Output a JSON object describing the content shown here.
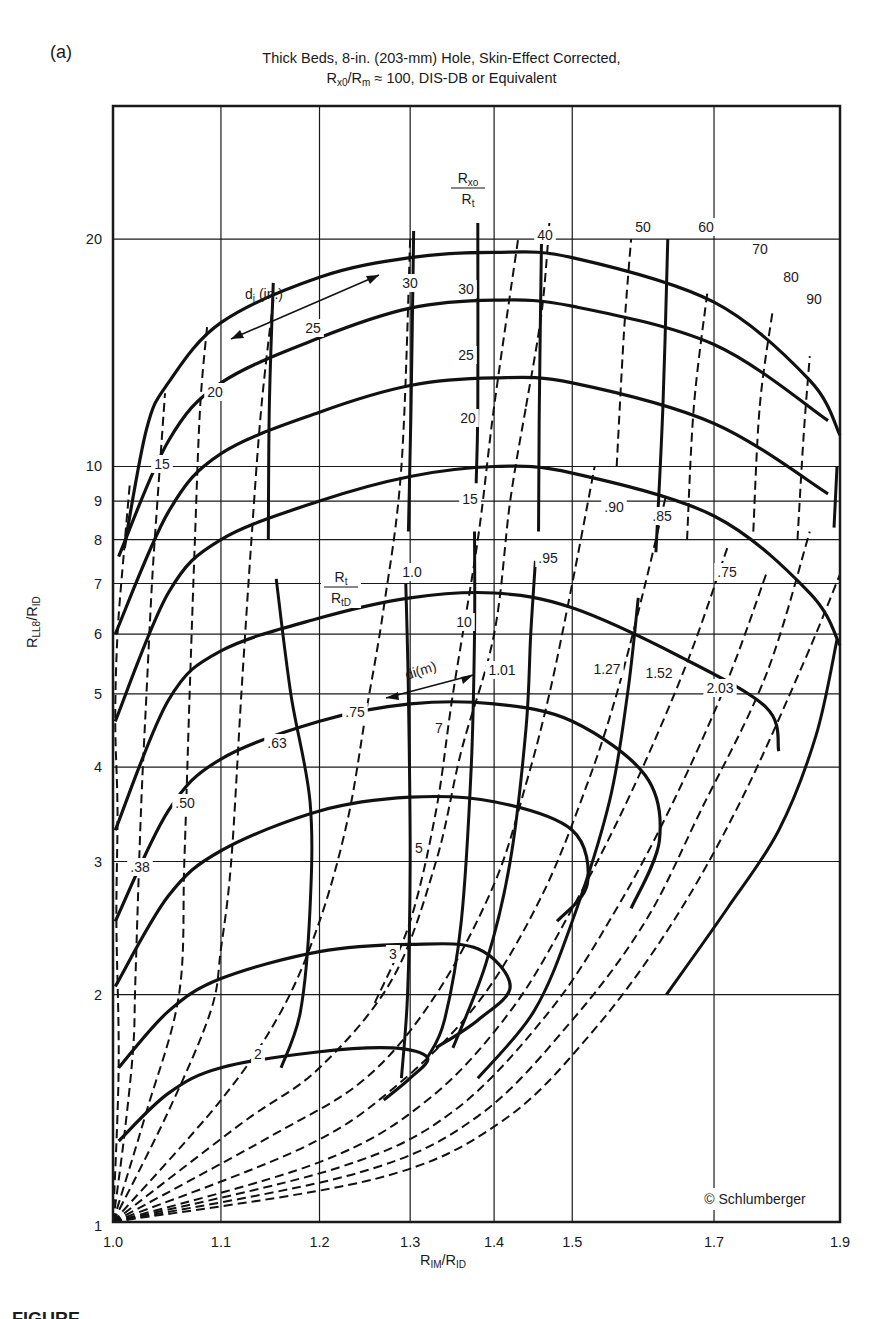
{
  "panel_label": "(a)",
  "title": {
    "line1": "Thick Beds, 8-in. (203-mm) Hole, Skin-Effect Corrected,",
    "line2_prefix": "R",
    "line2_sub1": "x0",
    "line2_mid": "/R",
    "line2_sub2": "m",
    "line2_suffix": " ≈ 100, DIS-DB or Equivalent"
  },
  "axes": {
    "x_title_main": "R",
    "x_title_sub1": "IM",
    "x_title_mid": "/R",
    "x_title_sub2": "ID",
    "y_title_main": "R",
    "y_title_sub1": "LL8",
    "y_title_mid": "/R",
    "y_title_sub2": "ID",
    "x_ticks": [
      "1.0",
      "1.1",
      "1.2",
      "1.3",
      "1.4",
      "1.5",
      "1.7",
      "1.9"
    ],
    "y_ticks": [
      "1",
      "2",
      "3",
      "4",
      "5",
      "6",
      "7",
      "8",
      "9",
      "10",
      "20"
    ]
  },
  "annotations": {
    "rxo_rt_num": "R",
    "rxo_rt_num_sub": "xo",
    "rxo_rt_den": "R",
    "rxo_rt_den_sub": "t",
    "rt_rtd_num": "R",
    "rt_rtd_num_sub": "t",
    "rt_rtd_den": "R",
    "rt_rtd_den_sub": "tD",
    "di_in": "d",
    "di_in_sub": "i",
    "di_in_unit": " (in.)",
    "di_m": "di(m)",
    "copyright": "© Schlumberger"
  },
  "caption_visible": "FIGURE",
  "chart_data": {
    "type": "line",
    "xlabel": "RIM/RID",
    "ylabel": "RLL8/RID",
    "xscale": "log",
    "yscale": "log",
    "xlim": [
      1.0,
      1.9
    ],
    "ylim": [
      1,
      30
    ],
    "grid": true,
    "x_ticks": [
      1.0,
      1.1,
      1.2,
      1.3,
      1.4,
      1.5,
      1.7,
      1.9
    ],
    "y_ticks": [
      1,
      2,
      3,
      4,
      5,
      6,
      7,
      8,
      9,
      10,
      20
    ],
    "rxo_rt_curves": {
      "style": "solid",
      "labels": [
        "2",
        "3",
        "5",
        "7",
        "10",
        "15",
        "20",
        "25",
        "30"
      ]
    },
    "rxo_rt_top_labels": [
      "40",
      "50",
      "60",
      "70",
      "80",
      "90"
    ],
    "di_in_curves": {
      "style": "dashed",
      "labels": [
        "15",
        "20",
        "25",
        "30"
      ]
    },
    "di_m_labels": [
      ".38",
      ".50",
      ".63",
      ".75",
      "1.01",
      "1.27",
      "1.52",
      "2.03"
    ],
    "rt_rtd_curves": {
      "style": "solid",
      "labels": [
        "1.0",
        ".95",
        ".90",
        ".85",
        ".75"
      ]
    },
    "series": [
      {
        "name": "Rxo/Rt=2",
        "points": [
          [
            1.005,
            1.28
          ],
          [
            1.05,
            1.48
          ],
          [
            1.1,
            1.6
          ],
          [
            1.2,
            1.68
          ],
          [
            1.28,
            1.7
          ],
          [
            1.32,
            1.65
          ],
          [
            1.3,
            1.55
          ],
          [
            1.27,
            1.45
          ]
        ]
      },
      {
        "name": "Rxo/Rt=3",
        "points": [
          [
            1.005,
            1.6
          ],
          [
            1.05,
            1.9
          ],
          [
            1.1,
            2.1
          ],
          [
            1.2,
            2.28
          ],
          [
            1.3,
            2.33
          ],
          [
            1.38,
            2.3
          ],
          [
            1.42,
            2.05
          ],
          [
            1.38,
            1.85
          ],
          [
            1.33,
            1.7
          ]
        ]
      },
      {
        "name": "Rxo/Rt=5",
        "points": [
          [
            1.002,
            2.05
          ],
          [
            1.05,
            2.7
          ],
          [
            1.1,
            3.1
          ],
          [
            1.2,
            3.5
          ],
          [
            1.3,
            3.65
          ],
          [
            1.4,
            3.6
          ],
          [
            1.5,
            3.3
          ],
          [
            1.52,
            2.8
          ],
          [
            1.48,
            2.5
          ]
        ]
      },
      {
        "name": "Rxo/Rt=7",
        "points": [
          [
            1.002,
            2.5
          ],
          [
            1.05,
            3.5
          ],
          [
            1.1,
            4.1
          ],
          [
            1.2,
            4.6
          ],
          [
            1.3,
            4.85
          ],
          [
            1.4,
            4.85
          ],
          [
            1.5,
            4.6
          ],
          [
            1.6,
            3.9
          ],
          [
            1.62,
            3.2
          ],
          [
            1.58,
            2.6
          ]
        ]
      },
      {
        "name": "Rxo/Rt=10",
        "points": [
          [
            1.002,
            3.3
          ],
          [
            1.05,
            4.9
          ],
          [
            1.1,
            5.7
          ],
          [
            1.2,
            6.3
          ],
          [
            1.3,
            6.7
          ],
          [
            1.4,
            6.8
          ],
          [
            1.5,
            6.5
          ],
          [
            1.65,
            5.6
          ],
          [
            1.78,
            4.8
          ],
          [
            1.8,
            4.2
          ]
        ]
      },
      {
        "name": "Rxo/Rt=15",
        "points": [
          [
            1.002,
            4.6
          ],
          [
            1.05,
            6.8
          ],
          [
            1.1,
            8.0
          ],
          [
            1.2,
            9.0
          ],
          [
            1.3,
            9.7
          ],
          [
            1.4,
            10.0
          ],
          [
            1.5,
            9.8
          ],
          [
            1.7,
            8.6
          ],
          [
            1.85,
            6.8
          ],
          [
            1.9,
            5.8
          ]
        ]
      },
      {
        "name": "Rxo/Rt=20",
        "points": [
          [
            1.002,
            6.0
          ],
          [
            1.05,
            8.7
          ],
          [
            1.1,
            10.4
          ],
          [
            1.2,
            11.8
          ],
          [
            1.3,
            12.8
          ],
          [
            1.4,
            13.1
          ],
          [
            1.5,
            12.9
          ],
          [
            1.7,
            11.4
          ],
          [
            1.88,
            9.2
          ]
        ]
      },
      {
        "name": "Rxo/Rt=25",
        "points": [
          [
            1.005,
            7.6
          ],
          [
            1.05,
            10.8
          ],
          [
            1.1,
            12.9
          ],
          [
            1.2,
            14.8
          ],
          [
            1.3,
            16.2
          ],
          [
            1.4,
            16.6
          ],
          [
            1.5,
            16.3
          ],
          [
            1.7,
            14.5
          ],
          [
            1.88,
            11.5
          ]
        ]
      },
      {
        "name": "Rxo/Rt=30",
        "points": [
          [
            1.01,
            7.8
          ],
          [
            1.03,
            11.2
          ],
          [
            1.05,
            12.9
          ],
          [
            1.1,
            15.5
          ],
          [
            1.2,
            17.8
          ],
          [
            1.3,
            18.9
          ],
          [
            1.4,
            19.2
          ],
          [
            1.5,
            18.9
          ],
          [
            1.7,
            16.5
          ],
          [
            1.85,
            13.0
          ],
          [
            1.9,
            11.0
          ]
        ]
      }
    ]
  }
}
